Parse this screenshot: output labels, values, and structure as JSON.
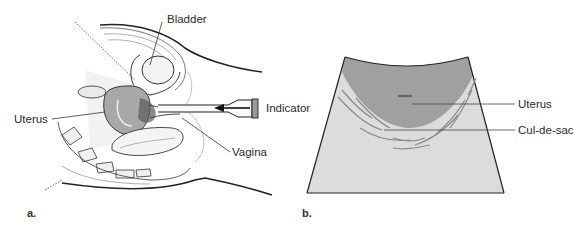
{
  "figure": {
    "panels": [
      {
        "id": "a",
        "letter": "a.",
        "description": "Sagittal pelvic anatomy with transvaginal probe",
        "labels": {
          "bladder": "Bladder",
          "uterus": "Uterus",
          "vagina": "Vagina",
          "indicator": "Indicator"
        }
      },
      {
        "id": "b",
        "letter": "b.",
        "description": "Sector ultrasound image schematic",
        "labels": {
          "uterus": "Uterus",
          "cul_de_sac": "Cul-de-sac"
        }
      }
    ]
  },
  "colors": {
    "line": "#222222",
    "uterus_fill": "#9a9a9a",
    "sector_fill": "#d9d9d9",
    "echo_lines": "#8a8a8a",
    "tissue_fill": "#ededed"
  }
}
